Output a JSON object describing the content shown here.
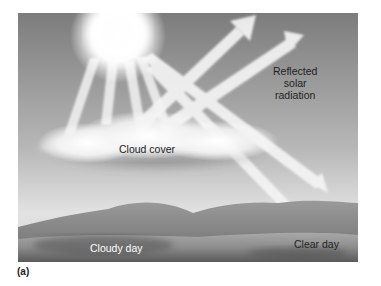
{
  "figure": {
    "panel_label": "(a)",
    "labels": {
      "reflected": [
        "Reflected",
        "solar",
        "radiation"
      ],
      "cloud_cover": "Cloud cover",
      "cloudy_day": "Cloudy day",
      "clear_day": "Clear day"
    },
    "colors": {
      "sky_top": "#7a7a7a",
      "sky_bottom": "#e4e4e4",
      "sun": "#ffffff",
      "rays": "#f2f2f2",
      "ground": "#8a8a8a",
      "text_dark": "#222222",
      "text_light": "#ffffff"
    }
  }
}
